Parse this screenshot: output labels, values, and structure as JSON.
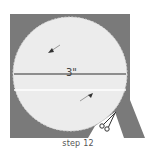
{
  "figure": {
    "caption": "step 12",
    "measurement_label": "3\"",
    "colors": {
      "background_paper": "#7a7a7a",
      "circle_fill": "#ececec",
      "line": "#6e6e6e",
      "fold_line": "#ffffff",
      "scissors": "#333333"
    },
    "icons": [
      "arrow-icon",
      "arrow-icon",
      "scissors-icon"
    ]
  }
}
